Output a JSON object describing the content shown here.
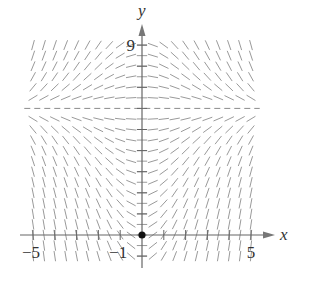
{
  "figure": {
    "type": "slope_field",
    "axes": {
      "x_label": "x",
      "y_label": "y",
      "x_tick_labels": [
        {
          "value": -5,
          "text": "−5"
        },
        {
          "value": -1,
          "text": "−1"
        },
        {
          "value": 5,
          "text": "5"
        }
      ],
      "y_tick_labels": [
        {
          "value": 9,
          "text": "9"
        }
      ],
      "xlim": [
        -5,
        5
      ],
      "ylim": [
        -1,
        9
      ]
    },
    "equilibrium_line": {
      "y": 6,
      "style": "dashed"
    },
    "initial_point": {
      "x": 0,
      "y": 0,
      "marker": "filled-circle"
    },
    "slope_rule": "slope ∝ x·(6 − y)",
    "grid_spacing": 0.5,
    "colors": {
      "axis": "#666666",
      "segments": "#9a9a9a",
      "dashed_line": "#8a8a8a",
      "point": "#111111",
      "text": "#333333"
    }
  }
}
